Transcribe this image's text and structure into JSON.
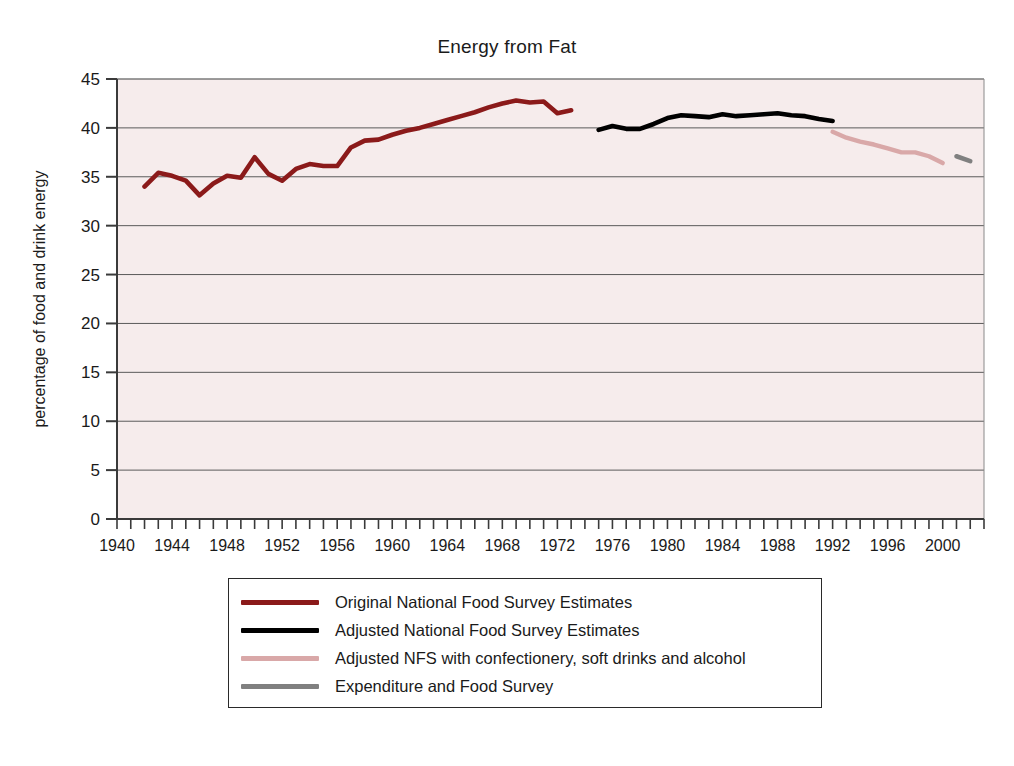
{
  "chart_data": {
    "type": "line",
    "title": "Energy from Fat",
    "xlabel": "",
    "ylabel": "percentage of food and drink energy",
    "xlim": [
      1940,
      2003
    ],
    "ylim": [
      0,
      45
    ],
    "grid": true,
    "y_ticks": [
      0,
      5,
      10,
      15,
      20,
      25,
      30,
      35,
      40,
      45
    ],
    "y_tick_labels": [
      "0",
      "5",
      "10",
      "15",
      "20",
      "25",
      "30",
      "35",
      "40",
      "45"
    ],
    "x_ticks": [
      1940,
      1941,
      1942,
      1943,
      1944,
      1945,
      1946,
      1947,
      1948,
      1949,
      1950,
      1951,
      1952,
      1953,
      1954,
      1955,
      1956,
      1957,
      1958,
      1959,
      1960,
      1961,
      1962,
      1963,
      1964,
      1965,
      1966,
      1967,
      1968,
      1969,
      1970,
      1971,
      1972,
      1973,
      1974,
      1975,
      1976,
      1977,
      1978,
      1979,
      1980,
      1981,
      1982,
      1983,
      1984,
      1985,
      1986,
      1987,
      1988,
      1989,
      1990,
      1991,
      1992,
      1993,
      1994,
      1995,
      1996,
      1997,
      1998,
      1999,
      2000,
      2001,
      2002,
      2003
    ],
    "x_tick_labels": [
      "1940",
      "1944",
      "1948",
      "1952",
      "1956",
      "1960",
      "1964",
      "1968",
      "1972",
      "1976",
      "1980",
      "1984",
      "1988",
      "1992",
      "1996",
      "2000"
    ],
    "x_tick_label_years": [
      1940,
      1944,
      1948,
      1952,
      1956,
      1960,
      1964,
      1968,
      1972,
      1976,
      1980,
      1984,
      1988,
      1992,
      1996,
      2000
    ],
    "legend_position": "below-center",
    "plot_background": "#f6ecec",
    "series": [
      {
        "name": "Original National Food Survey Estimates",
        "color": "#8B1A1A",
        "x": [
          1942,
          1943,
          1944,
          1945,
          1946,
          1947,
          1948,
          1949,
          1950,
          1951,
          1952,
          1953,
          1954,
          1955,
          1956,
          1957,
          1958,
          1959,
          1960,
          1961,
          1962,
          1963,
          1964,
          1965,
          1966,
          1967,
          1968,
          1969,
          1970,
          1971,
          1972,
          1973
        ],
        "values": [
          34.0,
          35.4,
          35.1,
          34.6,
          33.1,
          34.3,
          35.1,
          34.9,
          37.0,
          35.3,
          34.6,
          35.8,
          36.3,
          36.1,
          36.1,
          38.0,
          38.7,
          38.8,
          39.3,
          39.7,
          40.0,
          40.4,
          40.8,
          41.2,
          41.6,
          42.1,
          42.5,
          42.8,
          42.6,
          42.7,
          41.5,
          41.8
        ]
      },
      {
        "name": "Adjusted National Food Survey Estimates",
        "color": "#000000",
        "x": [
          1975,
          1976,
          1977,
          1978,
          1979,
          1980,
          1981,
          1982,
          1983,
          1984,
          1985,
          1986,
          1987,
          1988,
          1989,
          1990,
          1991,
          1992
        ],
        "values": [
          39.8,
          40.2,
          39.9,
          39.9,
          40.4,
          41.0,
          41.3,
          41.2,
          41.1,
          41.4,
          41.2,
          41.3,
          41.4,
          41.5,
          41.3,
          41.2,
          40.9,
          40.7
        ]
      },
      {
        "name": "Adjusted NFS with confectionery, soft drinks and alcohol",
        "color": "#D9A8A8",
        "x": [
          1992,
          1993,
          1994,
          1995,
          1996,
          1997,
          1998,
          1999,
          2000
        ],
        "values": [
          39.6,
          39.0,
          38.6,
          38.3,
          37.9,
          37.5,
          37.5,
          37.1,
          36.4
        ]
      },
      {
        "name": "Expenditure and Food Survey",
        "color": "#808080",
        "x": [
          2001,
          2002
        ],
        "values": [
          37.1,
          36.6
        ]
      }
    ]
  },
  "legend": {
    "items": [
      {
        "label": "Original National Food Survey Estimates",
        "color": "#8B1A1A"
      },
      {
        "label": "Adjusted National Food Survey Estimates",
        "color": "#000000"
      },
      {
        "label": "Adjusted NFS with confectionery, soft drinks and alcohol",
        "color": "#D9A8A8"
      },
      {
        "label": "Expenditure and Food Survey",
        "color": "#808080"
      }
    ]
  }
}
